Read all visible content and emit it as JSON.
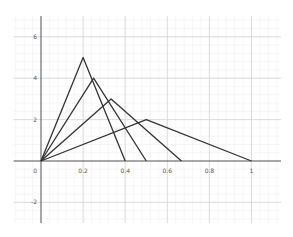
{
  "chart_data": {
    "type": "line",
    "title": "",
    "xlabel": "",
    "ylabel": "",
    "xlim": [
      -0.13,
      1.14
    ],
    "ylim": [
      -3.0,
      7.0
    ],
    "grid": true,
    "x_ticks": [
      "0.2",
      "0.4",
      "0.6",
      "0.8",
      "1"
    ],
    "x_tick_values": [
      0.2,
      0.4,
      0.6,
      0.8,
      1
    ],
    "y_ticks": [
      "-2",
      "2",
      "4",
      "6"
    ],
    "y_tick_values": [
      -2,
      2,
      4,
      6
    ],
    "origin_label": "0",
    "series": [
      {
        "name": "triangle-1",
        "x": [
          0,
          0.2,
          0.4
        ],
        "y": [
          0,
          5,
          0
        ]
      },
      {
        "name": "triangle-2",
        "x": [
          0,
          0.25,
          0.5
        ],
        "y": [
          0,
          4,
          0
        ]
      },
      {
        "name": "triangle-3",
        "x": [
          0,
          0.333,
          0.667
        ],
        "y": [
          0,
          3,
          0
        ]
      },
      {
        "name": "triangle-4",
        "x": [
          0,
          0.5,
          1.0
        ],
        "y": [
          0,
          2,
          0
        ]
      }
    ],
    "line_color": "#333333"
  }
}
